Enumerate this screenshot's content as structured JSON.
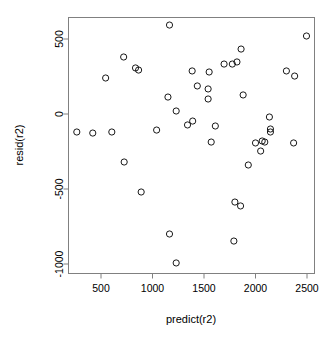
{
  "chart_data": {
    "type": "scatter",
    "title": "",
    "xlabel": "predict(r2)",
    "ylabel": "resid(r2)",
    "xticks": [
      500,
      1000,
      1500,
      2000,
      2500
    ],
    "yticks": [
      500,
      0,
      -500,
      -1000
    ],
    "xtick_labels": [
      "500",
      "1000",
      "1500",
      "2000",
      "2500"
    ],
    "ytick_labels": [
      "500",
      "0",
      "-500",
      "-1000"
    ],
    "xlim": [
      220,
      2660
    ],
    "ylim": [
      -1070,
      700
    ],
    "grid": false,
    "legend": null,
    "marker": "open-circle",
    "marker_color": "#000000",
    "points": [
      {
        "x": 265,
        "y": -120
      },
      {
        "x": 420,
        "y": -127
      },
      {
        "x": 605,
        "y": -120
      },
      {
        "x": 545,
        "y": 240
      },
      {
        "x": 720,
        "y": 380
      },
      {
        "x": 835,
        "y": 307
      },
      {
        "x": 865,
        "y": 293
      },
      {
        "x": 1165,
        "y": 593
      },
      {
        "x": 1150,
        "y": 113
      },
      {
        "x": 1230,
        "y": 20
      },
      {
        "x": 1040,
        "y": -107
      },
      {
        "x": 1340,
        "y": -73
      },
      {
        "x": 1390,
        "y": -47
      },
      {
        "x": 1385,
        "y": 287
      },
      {
        "x": 1435,
        "y": 187
      },
      {
        "x": 1550,
        "y": 280
      },
      {
        "x": 1540,
        "y": 167
      },
      {
        "x": 1540,
        "y": 100
      },
      {
        "x": 1570,
        "y": -187
      },
      {
        "x": 1610,
        "y": -80
      },
      {
        "x": 1695,
        "y": 333
      },
      {
        "x": 1775,
        "y": 333
      },
      {
        "x": 1820,
        "y": 347
      },
      {
        "x": 1860,
        "y": 433
      },
      {
        "x": 1880,
        "y": 127
      },
      {
        "x": 2000,
        "y": -193
      },
      {
        "x": 2065,
        "y": -180
      },
      {
        "x": 2135,
        "y": -20
      },
      {
        "x": 2145,
        "y": -100
      },
      {
        "x": 2145,
        "y": -120
      },
      {
        "x": 2300,
        "y": 287
      },
      {
        "x": 2380,
        "y": 253
      },
      {
        "x": 2370,
        "y": -193
      },
      {
        "x": 2495,
        "y": 520
      },
      {
        "x": 725,
        "y": -320
      },
      {
        "x": 890,
        "y": -520
      },
      {
        "x": 1165,
        "y": -800
      },
      {
        "x": 1230,
        "y": -993
      },
      {
        "x": 1800,
        "y": -587
      },
      {
        "x": 1855,
        "y": -613
      },
      {
        "x": 1790,
        "y": -847
      },
      {
        "x": 1930,
        "y": -340
      },
      {
        "x": 2050,
        "y": -247
      },
      {
        "x": 2090,
        "y": -187
      }
    ]
  },
  "labels": {
    "x_axis_title": "predict(r2)",
    "y_axis_title": "resid(r2)"
  }
}
